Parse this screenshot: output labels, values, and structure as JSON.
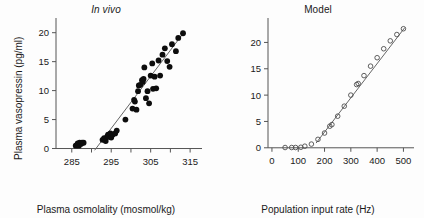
{
  "figure": {
    "background": "#fdfdfd",
    "panel_count": 2
  },
  "panels": {
    "left": {
      "title": "In vivo",
      "title_style": "italic",
      "xlabel": "Plasma osmolality (mosmol/kg)",
      "ylabel": "Plasma vasopressin (pg/ml)"
    },
    "right": {
      "title": "Model",
      "title_style": "normal",
      "xlabel": "Population input rate (Hz)",
      "ylabel": "Mean vasopressin (pg/ml)"
    }
  },
  "chart_data": [
    {
      "type": "scatter",
      "title": "In vivo",
      "xlabel": "Plasma osmolality (mosmol/kg)",
      "ylabel": "Plasma vasopressin (pg/ml)",
      "xlim": [
        281,
        317
      ],
      "ylim": [
        -0.6,
        21.5
      ],
      "xticks": [
        285,
        295,
        305,
        315
      ],
      "xticklabels": [
        "285",
        "295",
        "305",
        "315"
      ],
      "xminorticks": [
        290,
        300,
        310
      ],
      "yticks": [
        0,
        5,
        10,
        15,
        20
      ],
      "yticklabels": [
        "0",
        "5",
        "10",
        "15",
        "20"
      ],
      "grid": false,
      "legend": "none",
      "marker": "filled-circle",
      "marker_color": "#0d0d0d",
      "points": [
        {
          "x": 286.0,
          "y": 0.5
        },
        {
          "x": 286.3,
          "y": 0.6
        },
        {
          "x": 286.5,
          "y": 0.9
        },
        {
          "x": 286.8,
          "y": 0.5
        },
        {
          "x": 287.0,
          "y": 1.0
        },
        {
          "x": 287.3,
          "y": 0.8
        },
        {
          "x": 287.6,
          "y": 1.0
        },
        {
          "x": 288.0,
          "y": 1.0
        },
        {
          "x": 292.8,
          "y": 1.5
        },
        {
          "x": 293.2,
          "y": 1.8
        },
        {
          "x": 293.6,
          "y": 1.3
        },
        {
          "x": 294.0,
          "y": 2.1
        },
        {
          "x": 294.2,
          "y": 2.4
        },
        {
          "x": 294.4,
          "y": 2.0
        },
        {
          "x": 294.8,
          "y": 2.6
        },
        {
          "x": 295.0,
          "y": 1.9
        },
        {
          "x": 295.4,
          "y": 2.4
        },
        {
          "x": 296.0,
          "y": 2.6
        },
        {
          "x": 296.4,
          "y": 3.1
        },
        {
          "x": 298.6,
          "y": 5.0
        },
        {
          "x": 300.4,
          "y": 6.9
        },
        {
          "x": 300.8,
          "y": 8.4
        },
        {
          "x": 301.0,
          "y": 8.1
        },
        {
          "x": 301.4,
          "y": 6.7
        },
        {
          "x": 301.8,
          "y": 9.9
        },
        {
          "x": 302.0,
          "y": 10.9
        },
        {
          "x": 302.4,
          "y": 11.0
        },
        {
          "x": 302.8,
          "y": 11.8
        },
        {
          "x": 303.0,
          "y": 11.5
        },
        {
          "x": 303.2,
          "y": 12.0
        },
        {
          "x": 303.4,
          "y": 14.0
        },
        {
          "x": 303.8,
          "y": 8.7
        },
        {
          "x": 304.2,
          "y": 9.9
        },
        {
          "x": 304.6,
          "y": 7.8
        },
        {
          "x": 305.0,
          "y": 12.6
        },
        {
          "x": 305.4,
          "y": 14.7
        },
        {
          "x": 305.6,
          "y": 10.3
        },
        {
          "x": 306.0,
          "y": 12.4
        },
        {
          "x": 306.4,
          "y": 10.4
        },
        {
          "x": 307.0,
          "y": 15.2
        },
        {
          "x": 307.4,
          "y": 12.6
        },
        {
          "x": 308.0,
          "y": 16.2
        },
        {
          "x": 308.6,
          "y": 17.3
        },
        {
          "x": 309.2,
          "y": 15.1
        },
        {
          "x": 309.8,
          "y": 14.1
        },
        {
          "x": 310.4,
          "y": 18.0
        },
        {
          "x": 311.4,
          "y": 16.8
        },
        {
          "x": 312.0,
          "y": 19.1
        },
        {
          "x": 313.2,
          "y": 19.9
        }
      ],
      "fit_line": {
        "x1": 290.8,
        "y1": -0.3,
        "x2": 313.6,
        "y2": 20.2
      }
    },
    {
      "type": "scatter",
      "title": "Model",
      "xlabel": "Population input rate (Hz)",
      "ylabel": "Mean vasopressin (pg/ml)",
      "xlim": [
        -15,
        525
      ],
      "ylim": [
        -0.8,
        23.5
      ],
      "xticks": [
        0,
        100,
        200,
        300,
        400,
        500
      ],
      "xticklabels": [
        "0",
        "100",
        "200",
        "300",
        "400",
        "500"
      ],
      "yticks": [
        0,
        5,
        10,
        15,
        20
      ],
      "yticklabels": [
        "0",
        "5",
        "10",
        "15",
        "20"
      ],
      "grid": false,
      "legend": "none",
      "marker": "open-circle",
      "marker_color": "#4d4d4d",
      "points": [
        {
          "x": 50,
          "y": 0.05
        },
        {
          "x": 75,
          "y": 0.05
        },
        {
          "x": 90,
          "y": 0.05
        },
        {
          "x": 110,
          "y": 0.1
        },
        {
          "x": 125,
          "y": 0.3
        },
        {
          "x": 150,
          "y": 0.7
        },
        {
          "x": 175,
          "y": 1.6
        },
        {
          "x": 200,
          "y": 2.8
        },
        {
          "x": 220,
          "y": 4.1
        },
        {
          "x": 228,
          "y": 4.4
        },
        {
          "x": 250,
          "y": 6.0
        },
        {
          "x": 275,
          "y": 7.9
        },
        {
          "x": 300,
          "y": 10.0
        },
        {
          "x": 322,
          "y": 12.0
        },
        {
          "x": 328,
          "y": 12.2
        },
        {
          "x": 350,
          "y": 13.7
        },
        {
          "x": 375,
          "y": 15.5
        },
        {
          "x": 400,
          "y": 17.1
        },
        {
          "x": 425,
          "y": 18.8
        },
        {
          "x": 450,
          "y": 20.3
        },
        {
          "x": 475,
          "y": 21.5
        },
        {
          "x": 500,
          "y": 22.6
        }
      ],
      "fit_line": {
        "x1": 168,
        "y1": 0.9,
        "x2": 505,
        "y2": 22.8
      }
    }
  ]
}
